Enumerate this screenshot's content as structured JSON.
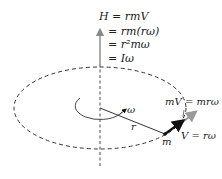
{
  "diagram": {
    "equations": [
      "H = rmV",
      "= rm(rω)",
      "= r²mω",
      "= Iω"
    ],
    "labels": {
      "omega": "ω",
      "radius": "r",
      "mass": "m",
      "momentum": "mV = mrω",
      "velocity": "V = rω"
    },
    "colors": {
      "line": "#222222",
      "axis_arrow": "#888888",
      "momentum_arrow": "#999999",
      "velocity_arrow": "#111111",
      "background": "#ffffff"
    }
  }
}
